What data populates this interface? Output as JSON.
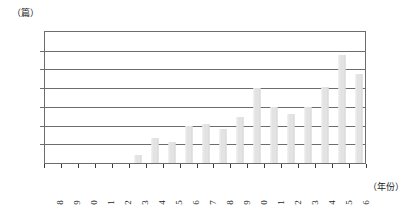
{
  "chart_data": {
    "type": "bar",
    "title": "",
    "subtitle": "",
    "xlabel": "（年份）",
    "ylabel": "（篇）",
    "y_unit_label": "（篇）",
    "x_unit_label": "（年份）",
    "categories": [
      "1998",
      "1999",
      "2000",
      "2001",
      "2002",
      "2003",
      "2004",
      "2005",
      "2006",
      "2007",
      "2008",
      "2009",
      "2010",
      "2011",
      "2012",
      "2013",
      "2014",
      "2015",
      "2016"
    ],
    "values": [
      0,
      0,
      0,
      1,
      1,
      22,
      67,
      55,
      100,
      105,
      92,
      123,
      200,
      150,
      131,
      150,
      202,
      288,
      237
    ],
    "ylim": [
      0,
      350
    ],
    "ytick_labels": [
      "0",
      "50",
      "100",
      "150",
      "200",
      "250",
      "300",
      "350"
    ],
    "ytick_values": [
      0,
      50,
      100,
      150,
      200,
      250,
      300,
      350
    ],
    "grid": true,
    "grid_axis": "y",
    "legend": false,
    "legend_position": "none",
    "bar_color": "#e3e3e3",
    "axis_color": "#6d6d6d",
    "text_color": "#1a1a1a"
  }
}
